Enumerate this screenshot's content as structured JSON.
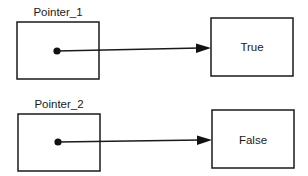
{
  "diagram": {
    "pointers": [
      {
        "label": "Pointer_1",
        "target_value": "True"
      },
      {
        "label": "Pointer_2",
        "target_value": "False"
      }
    ],
    "colors": {
      "stroke": "#1a1a1a",
      "background": "#ffffff"
    }
  }
}
